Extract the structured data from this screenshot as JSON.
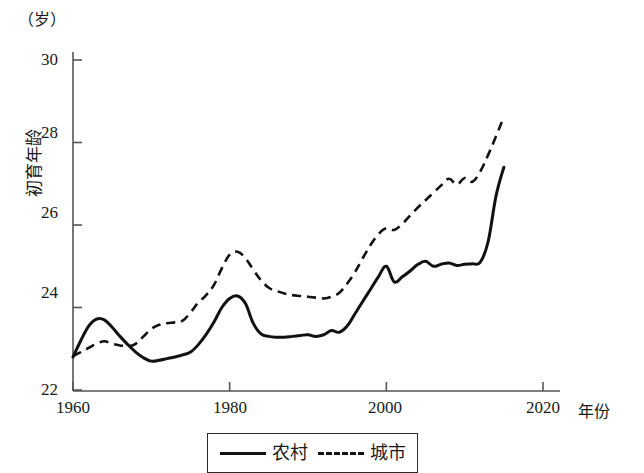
{
  "chart_data": {
    "type": "line",
    "title": "",
    "unit_label": "（岁）",
    "ylabel": "初育年龄",
    "xlabel": "年份",
    "xlim": [
      1960,
      2020
    ],
    "ylim": [
      22,
      30
    ],
    "xticks": [
      1960,
      1980,
      2000,
      2020
    ],
    "yticks": [
      22,
      24,
      26,
      28,
      30
    ],
    "grid": false,
    "legend_position": "bottom-center",
    "x": [
      1960,
      1961,
      1962,
      1963,
      1964,
      1965,
      1966,
      1967,
      1968,
      1969,
      1970,
      1971,
      1972,
      1973,
      1974,
      1975,
      1976,
      1977,
      1978,
      1979,
      1980,
      1981,
      1982,
      1983,
      1984,
      1985,
      1986,
      1987,
      1988,
      1989,
      1990,
      1991,
      1992,
      1993,
      1994,
      1995,
      1996,
      1997,
      1998,
      1999,
      2000,
      2001,
      2002,
      2003,
      2004,
      2005,
      2006,
      2007,
      2008,
      2009,
      2010,
      2011,
      2012,
      2013,
      2014,
      2015
    ],
    "series": [
      {
        "name": "农村",
        "style": "solid",
        "color": "#111111",
        "values": [
          22.8,
          23.2,
          23.55,
          23.72,
          23.7,
          23.52,
          23.3,
          23.1,
          22.92,
          22.78,
          22.7,
          22.72,
          22.76,
          22.8,
          22.85,
          22.92,
          23.1,
          23.35,
          23.65,
          24.0,
          24.22,
          24.28,
          24.1,
          23.62,
          23.36,
          23.3,
          23.28,
          23.28,
          23.3,
          23.32,
          23.34,
          23.3,
          23.34,
          23.44,
          23.4,
          23.55,
          23.85,
          24.15,
          24.45,
          24.75,
          25.0,
          24.62,
          24.74,
          24.88,
          25.04,
          25.12,
          25.0,
          25.05,
          25.08,
          25.02,
          25.05,
          25.06,
          25.1,
          25.6,
          26.7,
          27.4
        ]
      },
      {
        "name": "城市",
        "style": "dashed",
        "color": "#111111",
        "values": [
          22.82,
          22.92,
          23.02,
          23.12,
          23.18,
          23.12,
          23.08,
          23.06,
          23.12,
          23.3,
          23.48,
          23.58,
          23.62,
          23.64,
          23.68,
          23.88,
          24.12,
          24.3,
          24.55,
          24.95,
          25.28,
          25.35,
          25.2,
          24.92,
          24.66,
          24.48,
          24.4,
          24.34,
          24.3,
          24.28,
          24.26,
          24.24,
          24.22,
          24.26,
          24.36,
          24.58,
          24.86,
          25.2,
          25.52,
          25.78,
          25.92,
          25.88,
          26.02,
          26.22,
          26.42,
          26.6,
          26.78,
          26.96,
          27.12,
          26.98,
          27.14,
          27.05,
          27.3,
          27.7,
          28.15,
          28.62
        ]
      }
    ]
  },
  "axis": {
    "yticks_labels": [
      "22",
      "24",
      "26",
      "28",
      "30"
    ],
    "xticks_labels": [
      "1960",
      "1980",
      "2000",
      "2020"
    ],
    "unit": "（岁）",
    "ylabel": "初育年龄",
    "xlabel": "年份"
  },
  "legend": {
    "items": [
      {
        "label": "农村",
        "style": "solid"
      },
      {
        "label": "城市",
        "style": "dashed"
      }
    ]
  }
}
